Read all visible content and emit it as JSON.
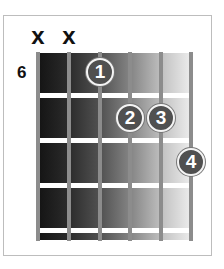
{
  "diagram": {
    "type": "guitar-chord-chart",
    "start_fret_label": "6",
    "strings": 6,
    "frets_shown": 4,
    "mutes": [
      {
        "string": 6,
        "label": "x"
      },
      {
        "string": 5,
        "label": "x"
      }
    ],
    "fingers": [
      {
        "label": "1",
        "string": 4,
        "fret": 1
      },
      {
        "label": "2",
        "string": 3,
        "fret": 2
      },
      {
        "label": "3",
        "string": 2,
        "fret": 2
      },
      {
        "label": "4",
        "string": 1,
        "fret": 3
      }
    ],
    "colors": {
      "board_dark": "#141414",
      "board_light": "#eeeeee",
      "string": "#8c8c8c",
      "fret": "#ffffff",
      "finger": "#505050",
      "frame": "#bdbdbd"
    }
  }
}
